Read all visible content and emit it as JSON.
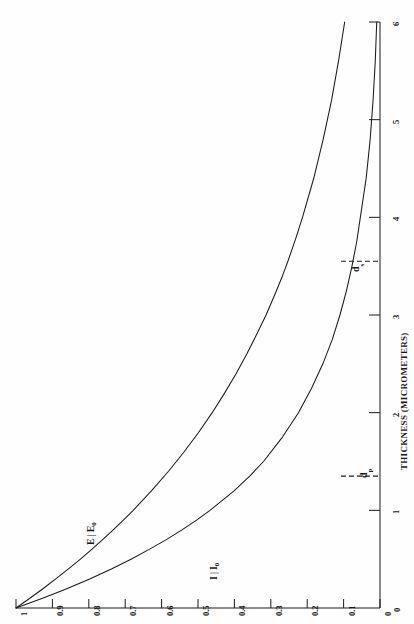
{
  "figure": {
    "background_color": "#fefefe",
    "ink_color": "#1a1a1a",
    "orientation_note": "page rotated 90 degrees; all text reads bottom-to-top"
  },
  "chart_data": {
    "type": "line",
    "title": "",
    "subtitle": "",
    "xlabel": "THICKNESS (MICROMETERS)",
    "ylabel": "",
    "xlim": [
      0,
      6
    ],
    "ylim": [
      0,
      1
    ],
    "grid": false,
    "legend_position": "inline-curve-labels",
    "x_ticks": [
      "0",
      "1",
      "2",
      "3",
      "4",
      "5",
      "6"
    ],
    "x_tick_values": [
      0,
      1,
      2,
      3,
      4,
      5,
      6
    ],
    "y_ticks": [
      "0",
      "0.1",
      "0.2",
      "0.3",
      "0.4",
      "0.5",
      "0.6",
      "0.7",
      "0.8",
      "0.9",
      "1"
    ],
    "y_tick_values": [
      0,
      0.1,
      0.2,
      0.3,
      0.4,
      0.5,
      0.6,
      0.7,
      0.8,
      0.9,
      1.0
    ],
    "series": [
      {
        "name": "E/E0",
        "label_num": "E",
        "label_den": "E",
        "label_den_sub": "0",
        "x": [
          0,
          0.1,
          0.2,
          0.3,
          0.4,
          0.5,
          0.6,
          0.7,
          0.8,
          0.9,
          1.0,
          1.2,
          1.4,
          1.6,
          1.8,
          2.0,
          2.2,
          2.4,
          2.6,
          2.8,
          3.0,
          3.2,
          3.4,
          3.55,
          3.8,
          4.0,
          4.4,
          4.8,
          5.2,
          5.6,
          6.0
        ],
        "values": [
          1.0,
          0.962,
          0.925,
          0.89,
          0.856,
          0.823,
          0.792,
          0.762,
          0.733,
          0.705,
          0.678,
          0.628,
          0.581,
          0.538,
          0.498,
          0.461,
          0.427,
          0.395,
          0.366,
          0.339,
          0.313,
          0.29,
          0.268,
          0.253,
          0.23,
          0.213,
          0.182,
          0.156,
          0.133,
          0.114,
          0.097
        ]
      },
      {
        "name": "I/I0",
        "label_num": "I",
        "label_den": "I",
        "label_den_sub": "0",
        "x": [
          0,
          0.1,
          0.2,
          0.3,
          0.4,
          0.5,
          0.6,
          0.7,
          0.8,
          0.9,
          1.0,
          1.2,
          1.35,
          1.5,
          1.75,
          2.0,
          2.25,
          2.5,
          2.75,
          3.0,
          3.25,
          3.5,
          3.75,
          4.0,
          4.4,
          4.8,
          5.2,
          5.6,
          6.0
        ],
        "values": [
          1.0,
          0.927,
          0.859,
          0.796,
          0.738,
          0.684,
          0.634,
          0.587,
          0.544,
          0.504,
          0.467,
          0.401,
          0.358,
          0.32,
          0.268,
          0.224,
          0.188,
          0.157,
          0.131,
          0.11,
          0.092,
          0.077,
          0.064,
          0.054,
          0.038,
          0.027,
          0.019,
          0.013,
          0.009
        ]
      }
    ],
    "markers": [
      {
        "name": "d_p",
        "label": "d",
        "sub": "p",
        "x": 1.35,
        "style": "dashed",
        "axis": "thickness"
      },
      {
        "name": "d_s",
        "label": "d",
        "sub": "s",
        "x": 3.55,
        "style": "dashed",
        "axis": "thickness"
      }
    ]
  },
  "axis": {
    "thickness_title": "THICKNESS (MICROMETERS)"
  }
}
